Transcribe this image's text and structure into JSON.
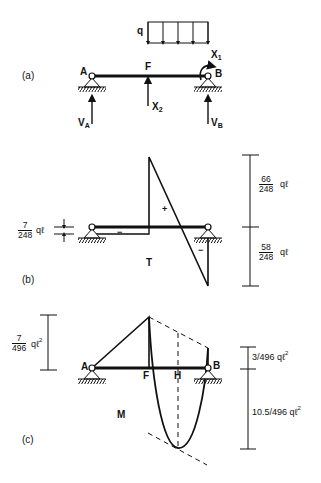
{
  "figure": {
    "panel_a": {
      "tag": "(a)",
      "load_label": "q",
      "point_a": "A",
      "point_f": "F",
      "point_b": "B",
      "moment_label": "X",
      "moment_sub": "1",
      "force_label": "X",
      "force_sub": "2",
      "reaction_a": "V",
      "reaction_a_sub": "A",
      "reaction_b": "V",
      "reaction_b_sub": "B"
    },
    "panel_b": {
      "tag": "(b)",
      "diagram_label": "T",
      "plus_sign": "+",
      "minus_left": "−",
      "minus_right": "−",
      "left_dim": {
        "num": "7",
        "den": "248",
        "suffix": "qℓ"
      },
      "top_dim": {
        "num": "66",
        "den": "248",
        "suffix": "qℓ"
      },
      "bottom_dim": {
        "num": "58",
        "den": "248",
        "suffix": "qℓ"
      }
    },
    "panel_c": {
      "tag": "(c)",
      "diagram_label": "M",
      "point_a": "A",
      "point_f": "F",
      "point_h": "H",
      "point_b": "B",
      "left_dim": {
        "num": "7",
        "den": "496",
        "suffix": "qℓ",
        "exp": "2"
      },
      "top_dim": {
        "text": "3/496 qℓ",
        "exp": "2"
      },
      "bottom_dim": {
        "text": "10.5/496 qℓ",
        "exp": "2"
      }
    }
  }
}
